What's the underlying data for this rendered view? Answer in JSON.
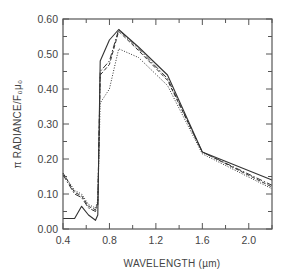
{
  "chart_data": {
    "type": "line",
    "title": "",
    "xlabel": "WAVELENGTH (µm)",
    "ylabel": "π RADIANCE/F₀μ₀",
    "xlim": [
      0.4,
      2.2
    ],
    "ylim": [
      0.0,
      0.6
    ],
    "grid": false,
    "legend": null,
    "x_ticks": [
      0.4,
      0.8,
      1.2,
      1.6,
      2.0
    ],
    "x_tick_labels": [
      "0.4",
      "0.8",
      "1.2",
      "1.6",
      "2.0"
    ],
    "x_minor_ticks": [
      0.6,
      1.0,
      1.4,
      1.8,
      2.2
    ],
    "y_ticks": [
      0.0,
      0.1,
      0.2,
      0.3,
      0.4,
      0.5,
      0.6
    ],
    "y_tick_labels": [
      "0.00",
      "0.10",
      "0.20",
      "0.30",
      "0.40",
      "0.50",
      "0.60"
    ],
    "y_minor_ticks": [
      0.05,
      0.15,
      0.25,
      0.35,
      0.45,
      0.55
    ],
    "series": [
      {
        "name": "solid-low",
        "style": "solid",
        "x": [
          0.4,
          0.5,
          0.56,
          0.62,
          0.68,
          0.7,
          0.72,
          0.8,
          0.88,
          1.05,
          1.3,
          1.6,
          2.2
        ],
        "y": [
          0.03,
          0.03,
          0.065,
          0.04,
          0.025,
          0.04,
          0.48,
          0.54,
          0.57,
          0.52,
          0.44,
          0.22,
          0.14
        ]
      },
      {
        "name": "dash-dot",
        "style": "dashdot",
        "x": [
          0.4,
          0.5,
          0.56,
          0.62,
          0.68,
          0.7,
          0.72,
          0.8,
          0.88,
          1.05,
          1.3,
          1.6,
          2.2
        ],
        "y": [
          0.155,
          0.1,
          0.09,
          0.06,
          0.05,
          0.07,
          0.45,
          0.48,
          0.57,
          0.515,
          0.43,
          0.22,
          0.125
        ]
      },
      {
        "name": "dashed",
        "style": "dashed",
        "x": [
          0.4,
          0.5,
          0.56,
          0.62,
          0.68,
          0.7,
          0.72,
          0.8,
          0.88,
          1.05,
          1.3,
          1.6,
          2.2
        ],
        "y": [
          0.16,
          0.105,
          0.095,
          0.065,
          0.055,
          0.075,
          0.44,
          0.47,
          0.565,
          0.51,
          0.425,
          0.22,
          0.12
        ]
      },
      {
        "name": "dotted",
        "style": "dotted",
        "x": [
          0.4,
          0.5,
          0.56,
          0.62,
          0.68,
          0.7,
          0.72,
          0.8,
          0.88,
          1.05,
          1.3,
          1.6,
          2.2
        ],
        "y": [
          0.16,
          0.11,
          0.1,
          0.07,
          0.06,
          0.08,
          0.36,
          0.4,
          0.515,
          0.49,
          0.41,
          0.215,
          0.115
        ]
      }
    ]
  }
}
